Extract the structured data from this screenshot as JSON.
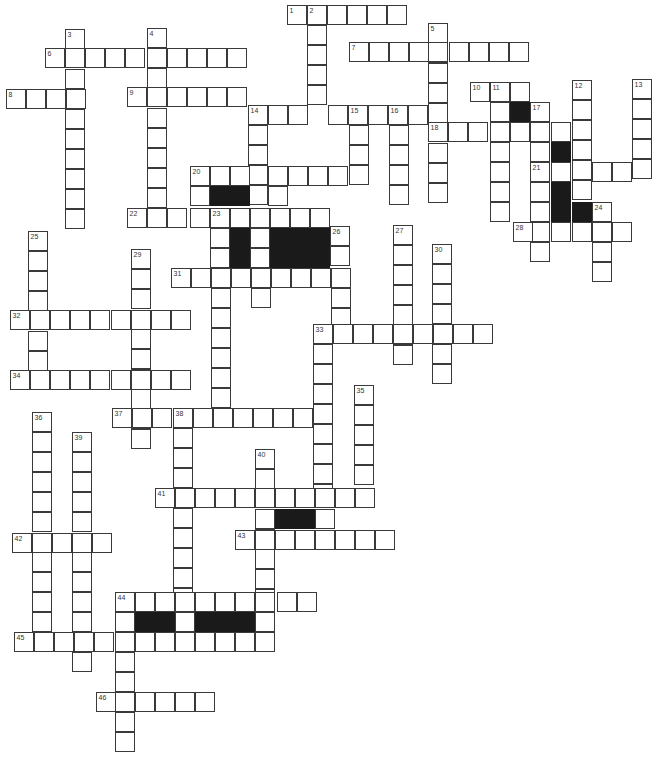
{
  "puzzle": {
    "type": "crossword",
    "cell_size": 20,
    "colors": {
      "cell_fill": "#ffffff",
      "cell_border": "#3a3a3a",
      "block_fill": "#1a1a1a",
      "background": "#ffffff"
    }
  },
  "cells": [
    [
      287,
      5,
      "1"
    ],
    [
      307,
      5,
      "2"
    ],
    [
      327,
      5
    ],
    [
      347,
      5
    ],
    [
      367,
      5
    ],
    [
      387,
      5
    ],
    [
      307,
      25
    ],
    [
      307,
      45
    ],
    [
      307,
      65
    ],
    [
      307,
      85
    ],
    [
      428,
      23,
      "5"
    ],
    [
      428,
      43
    ],
    [
      428,
      63
    ],
    [
      428,
      83
    ],
    [
      428,
      103
    ],
    [
      428,
      143
    ],
    [
      428,
      163
    ],
    [
      428,
      183
    ],
    [
      65,
      29,
      "3"
    ],
    [
      65,
      69
    ],
    [
      65,
      89
    ],
    [
      65,
      109
    ],
    [
      65,
      129
    ],
    [
      65,
      149
    ],
    [
      65,
      169
    ],
    [
      65,
      189
    ],
    [
      65,
      209
    ],
    [
      147,
      28,
      "4"
    ],
    [
      147,
      68
    ],
    [
      147,
      108
    ],
    [
      147,
      128
    ],
    [
      147,
      148
    ],
    [
      147,
      168
    ],
    [
      147,
      188
    ],
    [
      45,
      48,
      "6"
    ],
    [
      65,
      48
    ],
    [
      85,
      48
    ],
    [
      105,
      48
    ],
    [
      125,
      48
    ],
    [
      147,
      48
    ],
    [
      167,
      48
    ],
    [
      187,
      48
    ],
    [
      207,
      48
    ],
    [
      227,
      48
    ],
    [
      349,
      42,
      "7"
    ],
    [
      369,
      42
    ],
    [
      389,
      42
    ],
    [
      409,
      42
    ],
    [
      428,
      42
    ],
    [
      449,
      42
    ],
    [
      469,
      42
    ],
    [
      489,
      42
    ],
    [
      509,
      42
    ],
    [
      6,
      89,
      "8"
    ],
    [
      26,
      89
    ],
    [
      46,
      89
    ],
    [
      66,
      89
    ],
    [
      127,
      87,
      "9"
    ],
    [
      147,
      87
    ],
    [
      167,
      87
    ],
    [
      187,
      87
    ],
    [
      207,
      87
    ],
    [
      227,
      87
    ],
    [
      470,
      82,
      "10"
    ],
    [
      490,
      82,
      "11"
    ],
    [
      510,
      82
    ],
    [
      490,
      102
    ],
    [
      490,
      122
    ],
    [
      490,
      142
    ],
    [
      490,
      162
    ],
    [
      490,
      182
    ],
    [
      490,
      202
    ],
    [
      510,
      102,
      "",
      true
    ],
    [
      530,
      102,
      "17"
    ],
    [
      530,
      122
    ],
    [
      530,
      142
    ],
    [
      530,
      162,
      "21"
    ],
    [
      530,
      182
    ],
    [
      530,
      202
    ],
    [
      530,
      222
    ],
    [
      530,
      242
    ],
    [
      572,
      80,
      "12"
    ],
    [
      572,
      100
    ],
    [
      572,
      120
    ],
    [
      572,
      140
    ],
    [
      572,
      160
    ],
    [
      572,
      180
    ],
    [
      632,
      79,
      "13"
    ],
    [
      632,
      99
    ],
    [
      632,
      119
    ],
    [
      632,
      139
    ],
    [
      632,
      159
    ],
    [
      551,
      162
    ],
    [
      592,
      162
    ],
    [
      612,
      162
    ],
    [
      551,
      142,
      "",
      true
    ],
    [
      551,
      182,
      "",
      true
    ],
    [
      551,
      202,
      "",
      true
    ],
    [
      572,
      202,
      "",
      true
    ],
    [
      592,
      202,
      "24"
    ],
    [
      592,
      222
    ],
    [
      592,
      242
    ],
    [
      592,
      262
    ],
    [
      513,
      222,
      "28"
    ],
    [
      551,
      222
    ],
    [
      572,
      222
    ],
    [
      612,
      222
    ],
    [
      248,
      105,
      "14"
    ],
    [
      268,
      105
    ],
    [
      288,
      105
    ],
    [
      328,
      105
    ],
    [
      348,
      105,
      "15"
    ],
    [
      368,
      105
    ],
    [
      388,
      105,
      "16"
    ],
    [
      408,
      105
    ],
    [
      248,
      125
    ],
    [
      248,
      145
    ],
    [
      248,
      165
    ],
    [
      248,
      185
    ],
    [
      349,
      125
    ],
    [
      349,
      145
    ],
    [
      349,
      165
    ],
    [
      389,
      125
    ],
    [
      389,
      145
    ],
    [
      389,
      165
    ],
    [
      389,
      185
    ],
    [
      428,
      122,
      "18"
    ],
    [
      448,
      122
    ],
    [
      468,
      122
    ],
    [
      510,
      122
    ],
    [
      551,
      122
    ],
    [
      190,
      166,
      "20"
    ],
    [
      210,
      166
    ],
    [
      230,
      166
    ],
    [
      268,
      166
    ],
    [
      288,
      166
    ],
    [
      308,
      166
    ],
    [
      328,
      166
    ],
    [
      190,
      186
    ],
    [
      210,
      186,
      "",
      true
    ],
    [
      230,
      186,
      "",
      true
    ],
    [
      268,
      186
    ],
    [
      127,
      208,
      "22"
    ],
    [
      147,
      208
    ],
    [
      167,
      208
    ],
    [
      190,
      208
    ],
    [
      210,
      208,
      "23"
    ],
    [
      230,
      208
    ],
    [
      250,
      208
    ],
    [
      270,
      208
    ],
    [
      290,
      208
    ],
    [
      310,
      208
    ],
    [
      210,
      228
    ],
    [
      230,
      228,
      "",
      true
    ],
    [
      250,
      228
    ],
    [
      270,
      228,
      "",
      true
    ],
    [
      290,
      228,
      "",
      true
    ],
    [
      310,
      228,
      "",
      true
    ],
    [
      330,
      226,
      "26"
    ],
    [
      210,
      248
    ],
    [
      230,
      248,
      "",
      true
    ],
    [
      250,
      248
    ],
    [
      270,
      248,
      "",
      true
    ],
    [
      290,
      248,
      "",
      true
    ],
    [
      310,
      248,
      "",
      true
    ],
    [
      330,
      246
    ],
    [
      171,
      268,
      "31"
    ],
    [
      191,
      268
    ],
    [
      211,
      268
    ],
    [
      231,
      268
    ],
    [
      251,
      268
    ],
    [
      271,
      268
    ],
    [
      291,
      268
    ],
    [
      311,
      268
    ],
    [
      331,
      268
    ],
    [
      211,
      288
    ],
    [
      251,
      288
    ],
    [
      331,
      288
    ],
    [
      211,
      308
    ],
    [
      331,
      308
    ],
    [
      211,
      328
    ],
    [
      211,
      348
    ],
    [
      211,
      368
    ],
    [
      211,
      388
    ],
    [
      393,
      225,
      "27"
    ],
    [
      393,
      245
    ],
    [
      393,
      265
    ],
    [
      393,
      285
    ],
    [
      393,
      305
    ],
    [
      393,
      325
    ],
    [
      393,
      345
    ],
    [
      432,
      244,
      "30"
    ],
    [
      432,
      264
    ],
    [
      432,
      284
    ],
    [
      432,
      304
    ],
    [
      432,
      324
    ],
    [
      432,
      344
    ],
    [
      432,
      364
    ],
    [
      28,
      231,
      "25"
    ],
    [
      28,
      251
    ],
    [
      28,
      271
    ],
    [
      28,
      291
    ],
    [
      28,
      331
    ],
    [
      28,
      351
    ],
    [
      131,
      249,
      "29"
    ],
    [
      131,
      269
    ],
    [
      131,
      289
    ],
    [
      131,
      329
    ],
    [
      131,
      349
    ],
    [
      131,
      369
    ],
    [
      131,
      389
    ],
    [
      131,
      409
    ],
    [
      131,
      429
    ],
    [
      10,
      310,
      "32"
    ],
    [
      30,
      310
    ],
    [
      50,
      310
    ],
    [
      70,
      310
    ],
    [
      90,
      310
    ],
    [
      111,
      310
    ],
    [
      131,
      310
    ],
    [
      151,
      310
    ],
    [
      171,
      310
    ],
    [
      313,
      324,
      "33"
    ],
    [
      333,
      324
    ],
    [
      353,
      324
    ],
    [
      373,
      324
    ],
    [
      393,
      324
    ],
    [
      413,
      324
    ],
    [
      433,
      324
    ],
    [
      453,
      324
    ],
    [
      473,
      324
    ],
    [
      313,
      344
    ],
    [
      313,
      364
    ],
    [
      313,
      384
    ],
    [
      313,
      404
    ],
    [
      313,
      424
    ],
    [
      313,
      444
    ],
    [
      313,
      464
    ],
    [
      313,
      484
    ],
    [
      10,
      370,
      "34"
    ],
    [
      30,
      370
    ],
    [
      50,
      370
    ],
    [
      70,
      370
    ],
    [
      90,
      370
    ],
    [
      111,
      370
    ],
    [
      131,
      370
    ],
    [
      151,
      370
    ],
    [
      171,
      370
    ],
    [
      112,
      408,
      "37"
    ],
    [
      132,
      408
    ],
    [
      152,
      408
    ],
    [
      173,
      408,
      "38"
    ],
    [
      193,
      408
    ],
    [
      213,
      408
    ],
    [
      233,
      408
    ],
    [
      253,
      408
    ],
    [
      273,
      408
    ],
    [
      293,
      408
    ],
    [
      173,
      428
    ],
    [
      173,
      448
    ],
    [
      173,
      468
    ],
    [
      173,
      508
    ],
    [
      173,
      528
    ],
    [
      173,
      548
    ],
    [
      173,
      568
    ],
    [
      173,
      588
    ],
    [
      354,
      385,
      "35"
    ],
    [
      354,
      405
    ],
    [
      354,
      425
    ],
    [
      354,
      445
    ],
    [
      354,
      465
    ],
    [
      32,
      412,
      "36"
    ],
    [
      32,
      432
    ],
    [
      32,
      452
    ],
    [
      32,
      472
    ],
    [
      32,
      492
    ],
    [
      32,
      512
    ],
    [
      32,
      552
    ],
    [
      32,
      572
    ],
    [
      32,
      592
    ],
    [
      32,
      612
    ],
    [
      72,
      432,
      "39"
    ],
    [
      72,
      452
    ],
    [
      72,
      472
    ],
    [
      72,
      492
    ],
    [
      72,
      512
    ],
    [
      72,
      552
    ],
    [
      72,
      572
    ],
    [
      72,
      592
    ],
    [
      72,
      612
    ],
    [
      72,
      652
    ],
    [
      255,
      449,
      "40"
    ],
    [
      255,
      469
    ],
    [
      255,
      509
    ],
    [
      255,
      529
    ],
    [
      255,
      549
    ],
    [
      255,
      569
    ],
    [
      255,
      589
    ],
    [
      155,
      488,
      "41"
    ],
    [
      175,
      488
    ],
    [
      195,
      488
    ],
    [
      215,
      488
    ],
    [
      235,
      488
    ],
    [
      255,
      488
    ],
    [
      275,
      488
    ],
    [
      295,
      488
    ],
    [
      315,
      488
    ],
    [
      335,
      488
    ],
    [
      355,
      488
    ],
    [
      275,
      509,
      "",
      true
    ],
    [
      295,
      509,
      "",
      true
    ],
    [
      315,
      509
    ],
    [
      12,
      533,
      "42"
    ],
    [
      32,
      533
    ],
    [
      52,
      533
    ],
    [
      72,
      533
    ],
    [
      92,
      533
    ],
    [
      235,
      530,
      "43"
    ],
    [
      255,
      530
    ],
    [
      275,
      530
    ],
    [
      295,
      530
    ],
    [
      315,
      530
    ],
    [
      335,
      530
    ],
    [
      355,
      530
    ],
    [
      375,
      530
    ],
    [
      115,
      592,
      "44"
    ],
    [
      135,
      592
    ],
    [
      155,
      592
    ],
    [
      175,
      592
    ],
    [
      195,
      592
    ],
    [
      215,
      592
    ],
    [
      235,
      592
    ],
    [
      255,
      592
    ],
    [
      277,
      592
    ],
    [
      297,
      592
    ],
    [
      115,
      612
    ],
    [
      135,
      612,
      "",
      true
    ],
    [
      155,
      612,
      "",
      true
    ],
    [
      175,
      612
    ],
    [
      195,
      612,
      "",
      true
    ],
    [
      215,
      612,
      "",
      true
    ],
    [
      235,
      612,
      "",
      true
    ],
    [
      255,
      612
    ],
    [
      14,
      632,
      "45"
    ],
    [
      34,
      632
    ],
    [
      54,
      632
    ],
    [
      74,
      632
    ],
    [
      94,
      632
    ],
    [
      115,
      632
    ],
    [
      135,
      632
    ],
    [
      155,
      632
    ],
    [
      175,
      632
    ],
    [
      195,
      632
    ],
    [
      215,
      632
    ],
    [
      235,
      632
    ],
    [
      255,
      632
    ],
    [
      115,
      652
    ],
    [
      115,
      672
    ],
    [
      115,
      692
    ],
    [
      115,
      712
    ],
    [
      115,
      732
    ],
    [
      96,
      692,
      "46"
    ],
    [
      135,
      692
    ],
    [
      155,
      692
    ],
    [
      175,
      692
    ],
    [
      195,
      692
    ]
  ]
}
